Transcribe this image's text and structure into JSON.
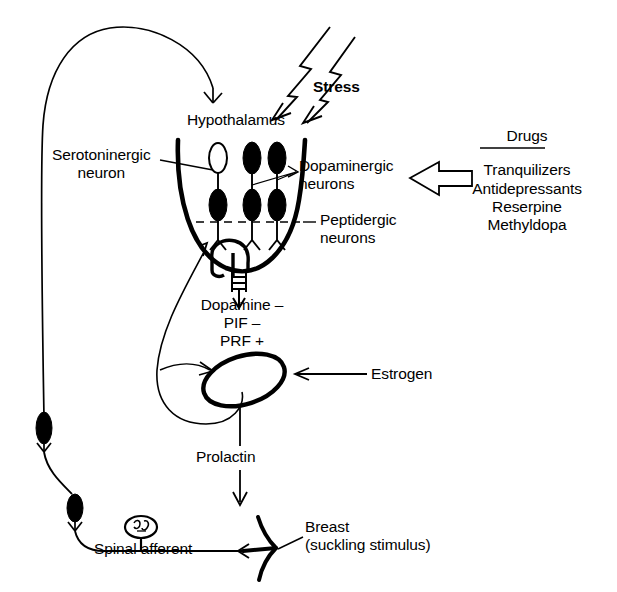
{
  "diagram": {
    "background_color": "#ffffff",
    "ink_color": "#000000"
  },
  "labels": {
    "stress": "Stress",
    "hypothalamus": "Hypothalamus",
    "serotoninergic_neuron_line1": "Serotoninergic",
    "serotoninergic_neuron_line2": "neuron",
    "dopaminergic_neurons_line1": "Dopaminergic",
    "dopaminergic_neurons_line2": "neurons",
    "peptidergic_neurons_line1": "Peptidergic",
    "peptidergic_neurons_line2": "neurons",
    "dopamine": "Dopamine –",
    "pif": "PIF –",
    "prf": "PRF +",
    "estrogen": "Estrogen",
    "prolactin": "Prolactin",
    "spinal_afferent": "Spinal afferent",
    "breast_line1": "Breast",
    "breast_line2": "(suckling stimulus)"
  },
  "drugs_panel": {
    "heading": "Drugs",
    "items": [
      "Tranquilizers",
      "Antidepressants",
      "Reserpine",
      "Methyldopa"
    ]
  },
  "icons": {
    "stress_bolt": "lightning-bolt-icon",
    "drugs_arrow": "hollow-block-arrow-left-icon",
    "pituitary": "pituitary-gland-icon",
    "breast": "breast-nipple-icon",
    "ganglion": "spinal-ganglion-icon"
  }
}
